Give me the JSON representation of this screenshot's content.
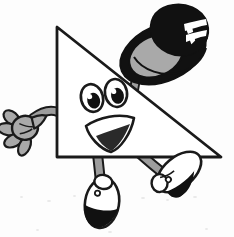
{
  "artwork": {
    "title": "Cartoon Triangle Character Tipping a Top Hat",
    "type": "line-art-clipart",
    "background_color": "#fdfdfd",
    "canvas": {
      "width": 234,
      "height": 237
    }
  },
  "palette": {
    "outline": "#1a1a1a",
    "black": "#111111",
    "gray_mid": "#a9a9a9",
    "gray_light": "#c9c9c9",
    "gray_dark": "#7d7d7d",
    "white": "#ffffff",
    "paper": "#fdfdfd",
    "speck": "#e9e9e9"
  },
  "parts": {
    "body": {
      "name": "triangle-body",
      "shape": "right-triangle",
      "fill": "#ffffff",
      "stroke": "#1a1a1a",
      "stroke_width": 2.6,
      "points": "57,27 57,157 221,157"
    },
    "face": {
      "eye_left": {
        "cx": 92,
        "cy": 97,
        "rx": 10.5,
        "ry": 13.5,
        "rotate": -12,
        "pupil": {
          "cx": 93,
          "cy": 100,
          "rx": 6.2,
          "ry": 7.8
        },
        "highlight": {
          "cx": 90,
          "cy": 95,
          "r": 2.4
        }
      },
      "eye_right": {
        "cx": 115,
        "cy": 92,
        "rx": 10.5,
        "ry": 13.5,
        "rotate": -10,
        "pupil": {
          "cx": 116,
          "cy": 95,
          "rx": 6.2,
          "ry": 7.8
        },
        "highlight": {
          "cx": 113,
          "cy": 90,
          "r": 2.4
        }
      },
      "mouth": {
        "outline": "M 88,127 C 100,119 118,116 132,121 C 128,136 118,148 110,150 C 100,148 91,137 88,127 Z",
        "shade": "M 95,136 C 104,133 116,130 127,127 C 122,138 115,147 110,149 C 103,146 98,141 95,136 Z"
      }
    },
    "left_arm": {
      "name": "left-arm",
      "path": "M 57,112 C 48,110 40,114 33,119",
      "stroke": "#8d8d8d",
      "width": 7
    },
    "left_hand": {
      "name": "left-glove-hand",
      "fill": "#a9a9a9",
      "fingers": 4,
      "center": {
        "cx": 22,
        "cy": 128
      }
    },
    "right_arm": {
      "name": "right-arm",
      "path": "M 134,96 C 135,84 138,74 141,66",
      "stroke": "#8d8d8d",
      "width": 7
    },
    "right_hand": {
      "name": "right-glove-hand-holding-hat",
      "fill": "#a9a9a9",
      "center": {
        "cx": 142,
        "cy": 62
      }
    },
    "hat": {
      "name": "top-hat",
      "crown_fill": "#111111",
      "brim_fill": "#111111",
      "brim_inner_fill": "#a9a9a9",
      "band_fill": "#ffffff",
      "rotate": -22,
      "center": {
        "cx": 163,
        "cy": 45
      }
    },
    "left_leg": {
      "name": "left-leg",
      "path": "M 98,157 C 99,170 100,180 101,188",
      "stroke": "#8d8d8d",
      "width": 7
    },
    "left_shoe": {
      "name": "left-shoe",
      "upper_fill": "#ffffff",
      "sole_fill": "#111111",
      "center": {
        "cx": 102,
        "cy": 203
      },
      "rotate": 8
    },
    "right_leg": {
      "name": "right-leg",
      "path": "M 140,157 C 148,165 155,170 162,175",
      "stroke": "#8d8d8d",
      "width": 7
    },
    "right_shoe": {
      "name": "right-shoe",
      "upper_fill": "#ffffff",
      "sole_fill": "#111111",
      "center": {
        "cx": 178,
        "cy": 172
      },
      "rotate": -38
    }
  },
  "specks": [
    {
      "x": 20,
      "y": 196,
      "w": 3,
      "h": 2
    },
    {
      "x": 47,
      "y": 200,
      "w": 4,
      "h": 2
    },
    {
      "x": 73,
      "y": 195,
      "w": 3,
      "h": 2
    },
    {
      "x": 141,
      "y": 197,
      "w": 4,
      "h": 2
    },
    {
      "x": 166,
      "y": 199,
      "w": 3,
      "h": 2
    },
    {
      "x": 193,
      "y": 196,
      "w": 4,
      "h": 2
    },
    {
      "x": 36,
      "y": 229,
      "w": 3,
      "h": 2
    },
    {
      "x": 108,
      "y": 231,
      "w": 4,
      "h": 2
    },
    {
      "x": 205,
      "y": 228,
      "w": 3,
      "h": 2
    }
  ]
}
